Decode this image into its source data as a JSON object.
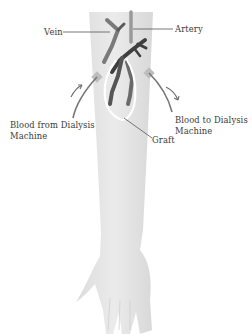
{
  "diagram": {
    "labels": {
      "vein": "Vein",
      "artery": "Artery",
      "blood_from": "Blood from Dialysis Machine",
      "blood_to": "Blood to Dialysis Machine",
      "graft": "Graft"
    },
    "colors": {
      "skin": "#e4e4e4",
      "skin_shade": "#d2d2d2",
      "vessel_dark": "#4a4a4a",
      "vessel_mid": "#7a7a7a",
      "needle": "#b8b8b8",
      "graft_outline": "#ffffff",
      "leader_line": "#555555",
      "arrow": "#6e6e6e",
      "text": "#3a3a3a"
    }
  }
}
